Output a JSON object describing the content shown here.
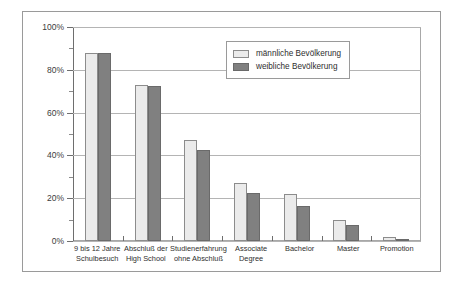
{
  "chart_data": {
    "type": "bar",
    "title": "",
    "xlabel": "",
    "ylabel": "",
    "ylim": [
      0,
      100
    ],
    "ytick_labels": [
      "0%",
      "20%",
      "40%",
      "60%",
      "80%",
      "100%"
    ],
    "ytick_values": [
      0,
      20,
      40,
      60,
      80,
      100
    ],
    "yminor_values": [
      10,
      30,
      50,
      70,
      90
    ],
    "grid": true,
    "legend_position": "top-right-inside",
    "categories": [
      "9 bis 12 Jahre Schulbesuch",
      "Abschluß der High School",
      "Studienerfahrung ohne Abschluß",
      "Associate Degree",
      "Bachelor",
      "Master",
      "Promotion"
    ],
    "category_lines": [
      [
        "9 bis 12 Jahre",
        "Schulbesuch"
      ],
      [
        "Abschluß der",
        "High School"
      ],
      [
        "Studienerfahrung",
        "ohne Abschluß"
      ],
      [
        "Associate",
        "Degree"
      ],
      [
        "Bachelor"
      ],
      [
        "Master"
      ],
      [
        "Promotion"
      ]
    ],
    "series": [
      {
        "name": "männliche Bevölkerung",
        "color": "#ebebeb",
        "values": [
          88,
          73,
          47,
          27,
          22,
          10,
          2
        ]
      },
      {
        "name": "weibliche Bevölkerung",
        "color": "#808080",
        "values": [
          88,
          72.5,
          42.5,
          22.5,
          16.5,
          7.5,
          0.8
        ]
      }
    ]
  },
  "legend": {
    "items": [
      {
        "label": "männliche Bevölkerung"
      },
      {
        "label": "weibliche Bevölkerung"
      }
    ]
  },
  "colors": {
    "male_fill": "#ebebeb",
    "female_fill": "#808080",
    "gridline": "#b4b4b4",
    "axis": "#6e6e6e",
    "frame": "#9a9a9a"
  }
}
